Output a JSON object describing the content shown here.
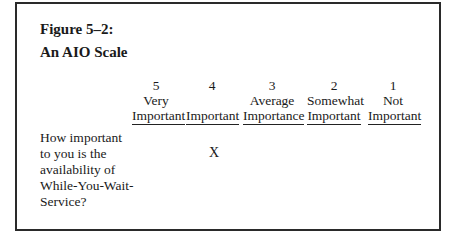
{
  "figure": {
    "label": "Figure 5–2:",
    "title": "An AIO Scale"
  },
  "scale": [
    {
      "value": "5",
      "line1": "Very",
      "line2": "Important"
    },
    {
      "value": "4",
      "line1": "",
      "line2": "Important"
    },
    {
      "value": "3",
      "line1": "Average",
      "line2": "Importance"
    },
    {
      "value": "2",
      "line1": "Somewhat",
      "line2": "Important"
    },
    {
      "value": "1",
      "line1": "Not",
      "line2": "Important"
    }
  ],
  "question": {
    "lines": [
      "How important",
      "to you is the",
      "availability of",
      "While-You-Wait-",
      "Service?"
    ],
    "response_mark": "X",
    "selected_value": "4"
  }
}
